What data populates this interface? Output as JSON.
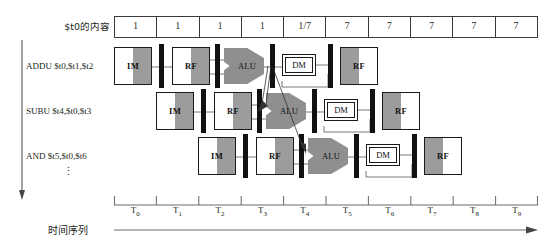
{
  "figure": {
    "register_label": "$t0的内容",
    "time_caption": "时间序列",
    "vertical_dots": "⋮"
  },
  "register_values": [
    {
      "value": "1"
    },
    {
      "value": "1"
    },
    {
      "value": "1"
    },
    {
      "value": "1"
    },
    {
      "value": "1/7"
    },
    {
      "value": "7"
    },
    {
      "value": "7"
    },
    {
      "value": "7"
    },
    {
      "value": "7"
    },
    {
      "value": "7"
    }
  ],
  "instructions": [
    {
      "text": "ADDU $t0,$t1,$t2"
    },
    {
      "text": "SUBU $t4,$t0,$t3"
    },
    {
      "text": "AND $t5,$t0,$t6"
    }
  ],
  "stages": {
    "im": "IM",
    "rf": "RF",
    "alu": "ALU",
    "dm": "DM",
    "wb": "RF"
  },
  "pipelines": [
    {
      "row": 0,
      "stages": [
        "IM",
        "RF",
        "ALU",
        "DM",
        "RF"
      ]
    },
    {
      "row": 1,
      "stages": [
        "IM",
        "RF",
        "ALU",
        "DM",
        "RF"
      ]
    },
    {
      "row": 2,
      "stages": [
        "IM",
        "RF",
        "ALU",
        "DM",
        "RF"
      ]
    }
  ],
  "time_ticks": [
    {
      "base": "T",
      "sub": "0"
    },
    {
      "base": "T",
      "sub": "1"
    },
    {
      "base": "T",
      "sub": "2"
    },
    {
      "base": "T",
      "sub": "3"
    },
    {
      "base": "T",
      "sub": "4"
    },
    {
      "base": "T",
      "sub": "5"
    },
    {
      "base": "T",
      "sub": "6"
    },
    {
      "base": "T",
      "sub": "7"
    },
    {
      "base": "T",
      "sub": "8"
    },
    {
      "base": "T",
      "sub": "9"
    }
  ],
  "colors": {
    "ink": "#231f20",
    "line": "#3a3a3a",
    "gray_fill": "#9c9c9c",
    "alu_fill": "#8f8f8f",
    "pipereg_fill": "#111111",
    "background": "#ffffff"
  }
}
